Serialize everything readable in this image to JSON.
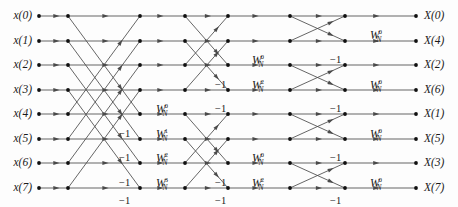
{
  "figure": {
    "kind": "fft-butterfly-signal-flow-graph",
    "radix": 2,
    "points": 8,
    "stages": 3,
    "background_color": "#fdfdfd",
    "line_color": "#4a4a4a",
    "node_color": "#101010",
    "text_color": "#1a1a1a"
  },
  "inputs": [
    {
      "label": "x(0)",
      "row": 0
    },
    {
      "label": "x(1)",
      "row": 1
    },
    {
      "label": "x(2)",
      "row": 2
    },
    {
      "label": "x(3)",
      "row": 3
    },
    {
      "label": "x(4)",
      "row": 4
    },
    {
      "label": "x(5)",
      "row": 5
    },
    {
      "label": "x(6)",
      "row": 6
    },
    {
      "label": "x(7)",
      "row": 7
    }
  ],
  "outputs": [
    {
      "label": "X(0)",
      "row": 0
    },
    {
      "label": "X(4)",
      "row": 1
    },
    {
      "label": "X(2)",
      "row": 2
    },
    {
      "label": "X(6)",
      "row": 3
    },
    {
      "label": "X(1)",
      "row": 4
    },
    {
      "label": "X(5)",
      "row": 5
    },
    {
      "label": "X(3)",
      "row": 6
    },
    {
      "label": "X(7)",
      "row": 7
    }
  ],
  "twiddles": [
    {
      "id": "s1-w0",
      "base": "W",
      "sub": "N",
      "sup": "0",
      "x": 156,
      "y": 104
    },
    {
      "id": "s1-w1",
      "base": "W",
      "sub": "N",
      "sup": "1",
      "x": 156,
      "y": 129
    },
    {
      "id": "s1-w2",
      "base": "W",
      "sub": "N",
      "sup": "2",
      "x": 156,
      "y": 153
    },
    {
      "id": "s1-w3",
      "base": "W",
      "sub": "N",
      "sup": "3",
      "x": 156,
      "y": 178
    },
    {
      "id": "s2-upper-w0",
      "base": "W",
      "sub": "N",
      "sup": "0",
      "x": 252,
      "y": 55
    },
    {
      "id": "s2-upper-w2",
      "base": "W",
      "sub": "N",
      "sup": "2",
      "x": 252,
      "y": 80
    },
    {
      "id": "s2-lower-w0",
      "base": "W",
      "sub": "N",
      "sup": "0",
      "x": 252,
      "y": 153
    },
    {
      "id": "s2-lower-w2",
      "base": "W",
      "sub": "N",
      "sup": "2",
      "x": 252,
      "y": 178
    },
    {
      "id": "s3-p0-w0",
      "base": "W",
      "sub": "N",
      "sup": "0",
      "x": 370,
      "y": 30
    },
    {
      "id": "s3-p1-w0",
      "base": "W",
      "sub": "N",
      "sup": "0",
      "x": 370,
      "y": 80
    },
    {
      "id": "s3-p2-w0",
      "base": "W",
      "sub": "N",
      "sup": "0",
      "x": 370,
      "y": 129
    },
    {
      "id": "s3-p3-w0",
      "base": "W",
      "sub": "N",
      "sup": "0",
      "x": 370,
      "y": 178
    }
  ],
  "minus_ones": [
    {
      "id": "s1-m0",
      "text": "−1",
      "x": 119,
      "y": 129
    },
    {
      "id": "s1-m1",
      "text": "−1",
      "x": 119,
      "y": 153
    },
    {
      "id": "s1-m2",
      "text": "−1",
      "x": 119,
      "y": 178
    },
    {
      "id": "s1-m3",
      "text": "−1",
      "x": 119,
      "y": 196
    },
    {
      "id": "s2-m0",
      "text": "−1",
      "x": 215,
      "y": 80
    },
    {
      "id": "s2-m1",
      "text": "−1",
      "x": 215,
      "y": 104
    },
    {
      "id": "s2-m2",
      "text": "−1",
      "x": 215,
      "y": 178
    },
    {
      "id": "s2-m3",
      "text": "−1",
      "x": 215,
      "y": 196
    },
    {
      "id": "s3-m0",
      "text": "−1",
      "x": 330,
      "y": 55
    },
    {
      "id": "s3-m1",
      "text": "−1",
      "x": 330,
      "y": 104
    },
    {
      "id": "s3-m2",
      "text": "−1",
      "x": 330,
      "y": 153
    },
    {
      "id": "s3-m3",
      "text": "−1",
      "x": 330,
      "y": 196
    }
  ],
  "geometry": {
    "row_y": [
      16,
      41,
      65,
      90,
      114,
      139,
      163,
      188
    ],
    "node_x": [
      39,
      68,
      140,
      185,
      228,
      290,
      345,
      416
    ],
    "input_label_x": 32,
    "output_label_x": 424
  },
  "graph": {
    "stage1_pairs": [
      [
        0,
        4
      ],
      [
        1,
        5
      ],
      [
        2,
        6
      ],
      [
        3,
        7
      ]
    ],
    "stage2_pairs": [
      [
        0,
        2
      ],
      [
        1,
        3
      ],
      [
        4,
        6
      ],
      [
        5,
        7
      ]
    ],
    "stage3_pairs": [
      [
        0,
        1
      ],
      [
        2,
        3
      ],
      [
        4,
        5
      ],
      [
        6,
        7
      ]
    ]
  }
}
